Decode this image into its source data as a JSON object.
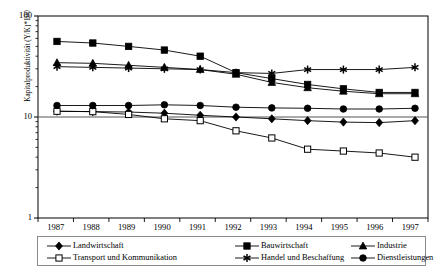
{
  "chart_data": {
    "type": "line",
    "title": "",
    "xlabel": "",
    "ylabel": "Kapitalproduktivität (Y/K)*100",
    "x": [
      "1987",
      "1988",
      "1989",
      "1990",
      "1991",
      "1992",
      "1993",
      "1994",
      "1995",
      "1996",
      "1997"
    ],
    "yscale": "log",
    "ylim": [
      1,
      100
    ],
    "ytick_labels": [
      "1",
      "10",
      "100"
    ],
    "ytick_values": [
      1,
      10,
      100
    ],
    "grid": false,
    "legend_position": "bottom",
    "series": [
      {
        "name": "Landwirtschaft",
        "marker": "filled-diamond",
        "values": [
          11.4,
          11.3,
          11.2,
          10.9,
          10.4,
          10.0,
          9.6,
          9.2,
          8.9,
          8.8,
          9.2
        ]
      },
      {
        "name": "Bauwirtschaft",
        "marker": "filled-square",
        "values": [
          56.0,
          54.0,
          50.0,
          46.0,
          40.0,
          27.5,
          24.0,
          21.0,
          19.0,
          17.5,
          17.5
        ]
      },
      {
        "name": "Industrie",
        "marker": "filled-triangle",
        "values": [
          34.5,
          34.0,
          32.5,
          31.0,
          29.5,
          26.5,
          22.0,
          19.5,
          18.0,
          17.0,
          17.0
        ]
      },
      {
        "name": "Transport und Kommunikation",
        "marker": "open-square",
        "values": [
          11.4,
          11.3,
          10.6,
          9.6,
          9.2,
          7.3,
          6.2,
          4.8,
          4.6,
          4.4,
          4.0
        ]
      },
      {
        "name": "Handel und Beschaffung",
        "marker": "asterisk",
        "values": [
          31.5,
          31.0,
          30.5,
          30.0,
          29.5,
          27.5,
          27.0,
          29.5,
          29.5,
          29.5,
          31.0
        ]
      },
      {
        "name": "Dienstleistungen",
        "marker": "filled-circle",
        "values": [
          13.0,
          13.0,
          13.0,
          13.2,
          13.0,
          12.5,
          12.3,
          12.2,
          12.0,
          12.0,
          12.2
        ]
      }
    ]
  }
}
